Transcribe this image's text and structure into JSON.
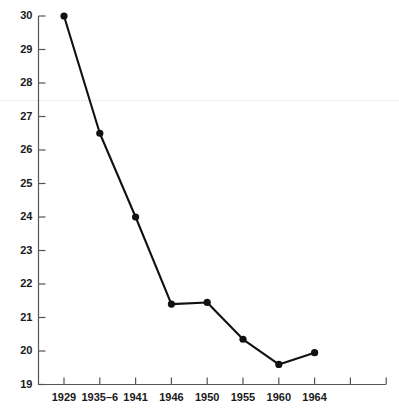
{
  "chart_data": {
    "type": "line",
    "title": "",
    "subtitle": "",
    "xlabel": "",
    "ylabel": "",
    "categories": [
      "1929",
      "1935–6",
      "1941",
      "1946",
      "1950",
      "1955",
      "1960",
      "1964"
    ],
    "values": [
      30.0,
      26.5,
      24.0,
      21.4,
      21.45,
      20.35,
      19.6,
      19.95
    ],
    "series": [
      {
        "name": "",
        "values": [
          30.0,
          26.5,
          24.0,
          21.4,
          21.45,
          20.35,
          19.6,
          19.95
        ]
      }
    ],
    "ylim": [
      19,
      30
    ],
    "ytick_labels": [
      "19",
      "20",
      "21",
      "22",
      "23",
      "24",
      "25",
      "26",
      "27",
      "28",
      "29",
      "30"
    ],
    "ytick_values": [
      19,
      20,
      21,
      22,
      23,
      24,
      25,
      26,
      27,
      28,
      29,
      30
    ],
    "xtick_labels": [
      "1929",
      "1935–6",
      "1941",
      "1946",
      "1950",
      "1955",
      "1960",
      "1964",
      "",
      ""
    ],
    "xtick_count": 10,
    "grid": false,
    "legend": "none",
    "marker": "filled-circle",
    "line_color": "#111111",
    "axis_color": "#555555",
    "text_color": "#1a1a1a",
    "background_color": "#ffffff",
    "annotations": []
  }
}
